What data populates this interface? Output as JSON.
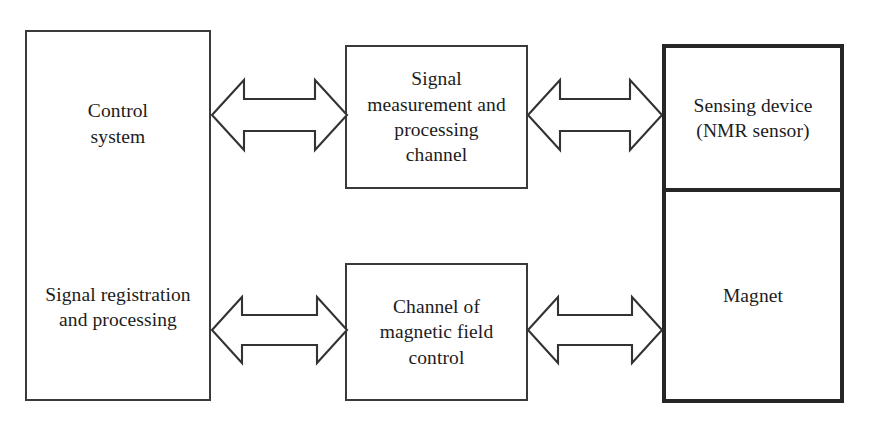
{
  "diagram": {
    "background_color": "#ffffff",
    "line_color": "#333333",
    "text_color": "#1c1c1c",
    "thick_border_color": "#262626"
  },
  "blocks": {
    "control_system": {
      "label": "Control\nsystem",
      "border": "thin"
    },
    "signal_registration": {
      "label": "Signal registration\nand processing",
      "border": "thin"
    },
    "signal_measurement": {
      "label": "Signal\nmeasurement and\nprocessing\nchannel",
      "border": "thin"
    },
    "magnetic_field_channel": {
      "label": "Channel of\nmagnetic field\ncontrol",
      "border": "thin"
    },
    "sensing_device": {
      "label": "Sensing device\n(NMR sensor)",
      "border": "thick"
    },
    "magnet": {
      "label": "Magnet",
      "border": "thick"
    }
  },
  "connectors": [
    {
      "name": "control-to-signal-measurement",
      "type": "double-headed-arrow",
      "from": "control_system",
      "to": "signal_measurement"
    },
    {
      "name": "signal-measurement-to-sensing-device",
      "type": "double-headed-arrow",
      "from": "signal_measurement",
      "to": "sensing_device"
    },
    {
      "name": "signal-registration-to-magnetic-channel",
      "type": "double-headed-arrow",
      "from": "signal_registration",
      "to": "magnetic_field_channel"
    },
    {
      "name": "magnetic-channel-to-magnet",
      "type": "double-headed-arrow",
      "from": "magnetic_field_channel",
      "to": "magnet"
    }
  ]
}
